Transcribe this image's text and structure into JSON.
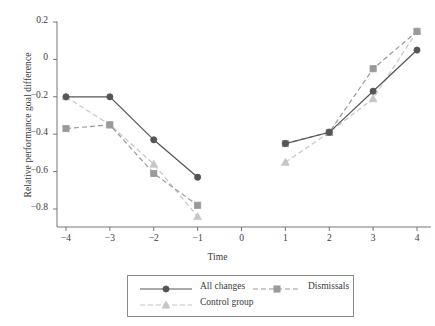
{
  "chart_data": {
    "type": "line",
    "title": "",
    "subtitle": "",
    "xlabel": "Time",
    "ylabel": "Relative performance goal difference",
    "x": [
      -4,
      -3,
      -2,
      -1,
      1,
      2,
      3,
      4
    ],
    "xticks": [
      "−4",
      "−3",
      "−2",
      "−1",
      "0",
      "1",
      "2",
      "3",
      "4"
    ],
    "xtick_values": [
      -4,
      -3,
      -2,
      -1,
      0,
      1,
      2,
      3,
      4
    ],
    "yticks": [
      "0.2",
      "0",
      "−0.2",
      "−0.4",
      "−0.6",
      "−0.8"
    ],
    "ytick_values": [
      0.2,
      0,
      -0.2,
      -0.4,
      -0.6,
      -0.8
    ],
    "xlim": [
      -4.45,
      4.45
    ],
    "ylim": [
      -0.88,
      0.24
    ],
    "grid": false,
    "legend_position": "below-center",
    "series": [
      {
        "name": "All changes",
        "marker": "circle",
        "linestyle": "solid",
        "color": "#555555",
        "x": [
          -4,
          -3,
          -2,
          -1,
          1,
          2,
          3,
          4
        ],
        "values": [
          -0.2,
          -0.2,
          -0.43,
          -0.63,
          -0.45,
          -0.39,
          -0.17,
          0.05
        ]
      },
      {
        "name": "Dismissals",
        "marker": "square",
        "linestyle": "dashed",
        "color": "#9a9a9a",
        "x": [
          -4,
          -3,
          -2,
          -1,
          1,
          2,
          3,
          4
        ],
        "values": [
          -0.37,
          -0.35,
          -0.61,
          -0.78,
          -0.45,
          -0.39,
          -0.05,
          0.15
        ]
      },
      {
        "name": "Control group",
        "marker": "triangle",
        "linestyle": "dashed",
        "color": "#c6c6c6",
        "x": [
          -4,
          -3,
          -2,
          -1,
          1,
          2,
          3,
          4
        ],
        "values": [
          -0.2,
          -0.35,
          -0.56,
          -0.84,
          -0.55,
          -0.39,
          -0.21,
          0.15
        ]
      }
    ],
    "break_at": 0,
    "note": "Series are plotted as two separate segments, split at Time = 0 (no data at 0)."
  },
  "legend": {
    "entries": [
      {
        "label": "All changes",
        "marker": "circle",
        "linestyle": "solid",
        "color": "#555555"
      },
      {
        "label": "Dismissals",
        "marker": "square",
        "linestyle": "dashed",
        "color": "#9a9a9a"
      },
      {
        "label": "Control group",
        "marker": "triangle",
        "linestyle": "dashed",
        "color": "#c6c6c6"
      }
    ]
  },
  "colors": {
    "axis": "#777777",
    "text": "#3a3a3a",
    "background": "#ffffff",
    "all_changes": "#555555",
    "dismissals": "#9a9a9a",
    "control_group": "#c6c6c6"
  }
}
